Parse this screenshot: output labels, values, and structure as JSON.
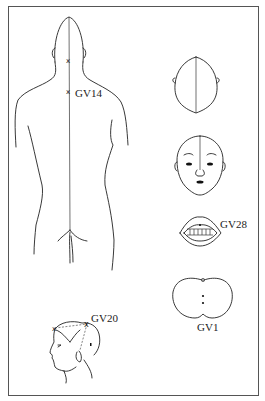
{
  "diagram": {
    "type": "acupuncture-point-illustration",
    "meridian": "Governing Vessel (GV)",
    "figures": [
      {
        "id": "back-view",
        "description": "Posterior view of torso with midline channel",
        "points": [
          "GV14"
        ]
      },
      {
        "id": "top-of-head",
        "description": "Superior view of head with midline"
      },
      {
        "id": "front-face",
        "description": "Frontal view of face with midline"
      },
      {
        "id": "mouth",
        "description": "Open mouth showing upper gum",
        "points": [
          "GV28"
        ]
      },
      {
        "id": "perineum",
        "description": "Buttocks / anal region",
        "points": [
          "GV1"
        ]
      },
      {
        "id": "side-head",
        "description": "Lateral view of head",
        "points": [
          "GV20"
        ]
      }
    ],
    "labels": {
      "gv14": "GV14",
      "gv28": "GV28",
      "gv1": "GV1",
      "gv20": "GV20"
    },
    "colors": {
      "line": "#222222",
      "border": "#555555",
      "background": "#ffffff"
    }
  }
}
